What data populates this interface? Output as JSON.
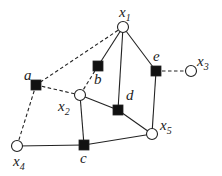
{
  "diagram": {
    "type": "bipartite-graph",
    "colors": {
      "stroke": "#222222",
      "variable_fill": "#ffffff",
      "factor_fill": "#111111",
      "background": "#ffffff"
    },
    "variable_nodes": [
      {
        "id": "x1",
        "label": "x",
        "sub": "1",
        "x": 123,
        "y": 27,
        "lx": 119,
        "ly": 17
      },
      {
        "id": "x2",
        "label": "x",
        "sub": "2",
        "x": 80,
        "y": 95,
        "lx": 58,
        "ly": 111
      },
      {
        "id": "x3",
        "label": "x",
        "sub": "3",
        "x": 191,
        "y": 71,
        "lx": 197,
        "ly": 66
      },
      {
        "id": "x4",
        "label": "x",
        "sub": "4",
        "x": 17,
        "y": 146,
        "lx": 13,
        "ly": 166
      },
      {
        "id": "x5",
        "label": "x",
        "sub": "5",
        "x": 152,
        "y": 134,
        "lx": 160,
        "ly": 130
      }
    ],
    "factor_nodes": [
      {
        "id": "a",
        "label": "a",
        "x": 36,
        "y": 85,
        "lx": 24,
        "ly": 80
      },
      {
        "id": "b",
        "label": "b",
        "x": 98,
        "y": 66,
        "lx": 94,
        "ly": 84
      },
      {
        "id": "c",
        "label": "c",
        "x": 84,
        "y": 145,
        "lx": 80,
        "ly": 163
      },
      {
        "id": "d",
        "label": "d",
        "x": 118,
        "y": 110,
        "lx": 126,
        "ly": 100
      },
      {
        "id": "e",
        "label": "e",
        "x": 156,
        "y": 71,
        "lx": 153,
        "ly": 61
      }
    ],
    "edges": [
      {
        "from": "x1",
        "to": "a",
        "style": "dashed"
      },
      {
        "from": "x1",
        "to": "b",
        "style": "solid"
      },
      {
        "from": "x1",
        "to": "d",
        "style": "solid"
      },
      {
        "from": "x1",
        "to": "e",
        "style": "solid"
      },
      {
        "from": "e",
        "to": "x3",
        "style": "dashed"
      },
      {
        "from": "e",
        "to": "x5",
        "style": "solid"
      },
      {
        "from": "b",
        "to": "x2",
        "style": "dashed"
      },
      {
        "from": "a",
        "to": "x2",
        "style": "dashed"
      },
      {
        "from": "a",
        "to": "x4",
        "style": "dashed"
      },
      {
        "from": "x2",
        "to": "d",
        "style": "solid"
      },
      {
        "from": "x2",
        "to": "c",
        "style": "solid"
      },
      {
        "from": "d",
        "to": "x5",
        "style": "solid"
      },
      {
        "from": "c",
        "to": "x5",
        "style": "solid"
      },
      {
        "from": "x4",
        "to": "c",
        "style": "solid"
      }
    ]
  }
}
